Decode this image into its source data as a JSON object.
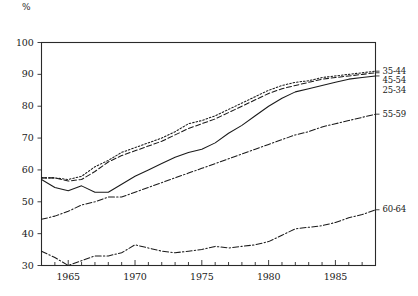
{
  "chart_data": {
    "type": "line",
    "title": "",
    "subtitle": "",
    "xlabel": "",
    "ylabel": "%",
    "unit_label": "%",
    "xlim": [
      1963,
      1988
    ],
    "ylim": [
      30,
      100
    ],
    "grid": false,
    "legend_position": "right-outside",
    "y_ticks": [
      30,
      40,
      50,
      60,
      70,
      80,
      90,
      100
    ],
    "x_ticks": [
      1965,
      1970,
      1975,
      1980,
      1985
    ],
    "x_minor_tick_interval": 1,
    "x": [
      1963,
      1964,
      1965,
      1966,
      1967,
      1968,
      1969,
      1970,
      1971,
      1972,
      1973,
      1974,
      1975,
      1976,
      1977,
      1978,
      1979,
      1980,
      1981,
      1982,
      1983,
      1984,
      1985,
      1986,
      1987,
      1988
    ],
    "series": [
      {
        "name": "35-44",
        "style": "dotted",
        "values": [
          57.5,
          57.5,
          57.0,
          58.0,
          61.0,
          63.0,
          65.5,
          67.0,
          68.5,
          70.0,
          72.0,
          74.5,
          75.5,
          77.0,
          79.0,
          81.0,
          83.0,
          85.0,
          86.5,
          87.5,
          88.0,
          89.0,
          89.5,
          90.0,
          90.5,
          91.0
        ]
      },
      {
        "name": "45-54",
        "style": "dashed",
        "values": [
          57.5,
          57.5,
          56.5,
          57.0,
          59.5,
          62.5,
          64.5,
          66.0,
          67.5,
          69.0,
          71.0,
          73.0,
          74.5,
          76.0,
          78.0,
          80.0,
          82.0,
          84.0,
          85.5,
          86.5,
          87.5,
          88.5,
          89.0,
          89.5,
          90.0,
          90.5
        ]
      },
      {
        "name": "25-34",
        "style": "solid",
        "values": [
          57.0,
          54.5,
          53.5,
          55.0,
          53.0,
          53.0,
          55.5,
          58.0,
          60.0,
          62.0,
          64.0,
          65.5,
          66.5,
          68.5,
          71.5,
          74.0,
          77.0,
          80.0,
          82.5,
          84.5,
          85.5,
          86.5,
          87.5,
          88.5,
          89.0,
          89.5
        ]
      },
      {
        "name": "55-59",
        "style": "dash-dot",
        "values": [
          44.5,
          45.5,
          47.0,
          49.0,
          50.0,
          51.5,
          51.5,
          53.0,
          54.5,
          56.0,
          57.5,
          59.0,
          60.5,
          62.0,
          63.5,
          65.0,
          66.5,
          68.0,
          69.5,
          71.0,
          72.0,
          73.5,
          74.5,
          75.5,
          76.5,
          77.5
        ]
      },
      {
        "name": "60-64",
        "style": "dash-dot",
        "values": [
          34.5,
          32.5,
          30.0,
          31.5,
          33.0,
          33.0,
          34.0,
          36.5,
          35.5,
          34.5,
          34.0,
          34.5,
          35.0,
          36.0,
          35.5,
          36.0,
          36.5,
          37.5,
          39.5,
          41.5,
          42.0,
          42.5,
          43.5,
          45.0,
          46.0,
          47.5
        ]
      }
    ]
  },
  "labels": {
    "unit": "%",
    "y_ticks": [
      "100",
      "90",
      "80",
      "70",
      "60",
      "50",
      "40",
      "30"
    ],
    "x_ticks": [
      "1965",
      "1970",
      "1975",
      "1980",
      "1985"
    ],
    "legend": [
      "35-44",
      "45-54",
      "25-34",
      "55-59",
      "60-64"
    ]
  },
  "colors": {
    "line": "#1a1a1a",
    "axis": "#2a2a2a",
    "background": "#ffffff"
  }
}
